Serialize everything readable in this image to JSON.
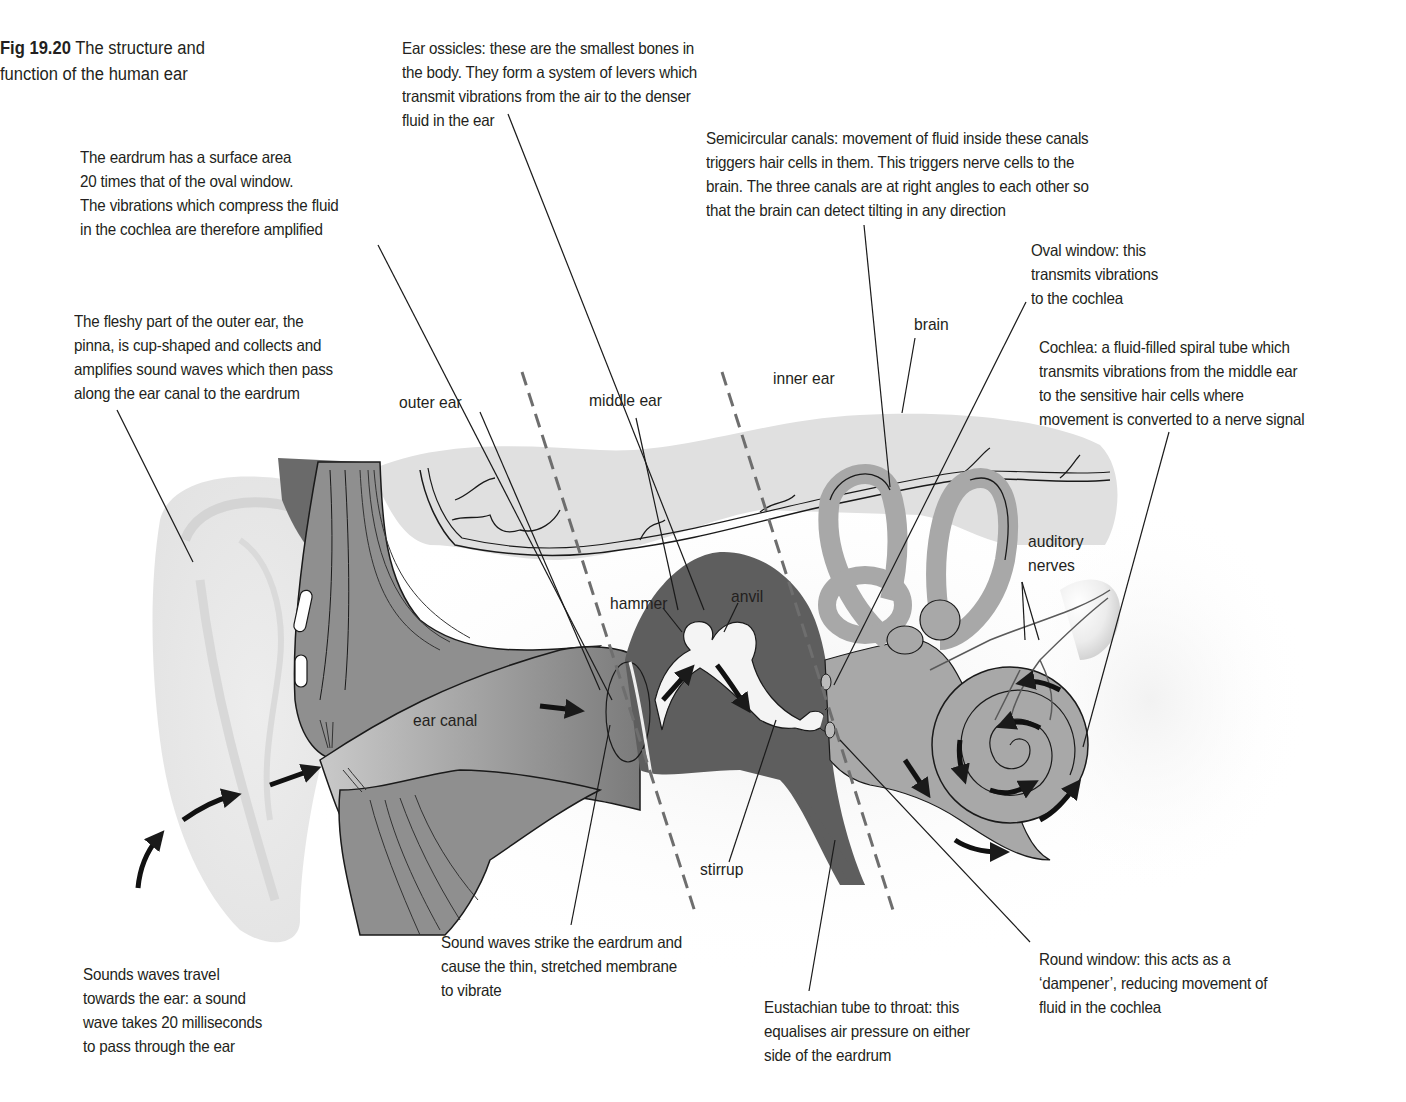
{
  "figure": {
    "number": "Fig 19.20",
    "title_line1": "The structure and",
    "title_line2": "function of the human ear"
  },
  "region_labels": {
    "outer_ear": "outer ear",
    "middle_ear": "middle ear",
    "inner_ear": "inner ear"
  },
  "part_labels": {
    "brain": "brain",
    "ear_canal": "ear canal",
    "hammer": "hammer",
    "anvil": "anvil",
    "stirrup": "stirrup",
    "auditory_nerves_1": "auditory",
    "auditory_nerves_2": "nerves"
  },
  "annotations": {
    "ear_ossicles": "Ear ossicles: these are the smallest bones in\nthe body. They form a system of levers which\ntransmit vibrations from the air to the denser\nfluid in the ear",
    "eardrum_area": "The eardrum has a surface area\n20 times that of the oval window.\nThe vibrations which compress the fluid\nin the cochlea are therefore amplified",
    "semicircular_canals": "Semicircular canals: movement of fluid inside these canals\ntriggers hair cells in them. This triggers nerve cells to the\nbrain. The three canals are at right angles to each other so\nthat the brain can detect tilting in any direction",
    "oval_window": "Oval window: this\ntransmits vibrations\nto the cochlea",
    "pinna": "The fleshy part of the outer ear, the\npinna, is cup-shaped and collects and\namplifies sound waves which then pass\nalong the ear canal to the eardrum",
    "cochlea": "Cochlea: a fluid-filled spiral tube which\ntransmits vibrations from the middle ear\nto the sensitive hair cells where\nmovement is converted to a nerve signal",
    "sound_waves_travel": "Sounds waves travel\ntowards the ear: a sound\nwave takes 20 milliseconds\nto pass through the ear",
    "eardrum_strike": "Sound waves strike the eardrum and\ncause the thin, stretched membrane\nto vibrate",
    "eustachian_tube": "Eustachian tube to throat: this\nequalises air pressure on either\nside of the eardrum",
    "round_window": "Round window: this acts as a\n‘dampener’, reducing movement of\nfluid in the cochlea"
  },
  "colors": {
    "text": "#231f20",
    "pinna_fill": "#ebebeb",
    "brain_fill": "#dedede",
    "canal_fill": "#9a9a9a",
    "middle_ear_fill": "#5e5e5e",
    "inner_ear_fill": "#a8a8a8",
    "bone_fill": "#f4f4f4",
    "dashed_line": "#6e6e6e"
  }
}
